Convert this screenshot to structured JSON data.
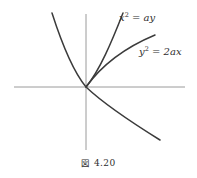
{
  "figure": {
    "caption_label": "図",
    "caption_number": "4.20",
    "background_color": "#ffffff",
    "curve_color": "#3b3b3b",
    "axis_color": "#9a9a9a"
  },
  "labels": {
    "parabola_up": {
      "variable": "x",
      "exponent": "2",
      "operator": "=",
      "expression": "ay",
      "full_text": "x2 = ay"
    },
    "parabola_right": {
      "variable": "y",
      "exponent": "2",
      "operator": "=",
      "expression": "2ax",
      "full_text": "y2 = 2ax"
    }
  },
  "chart_data": {
    "type": "line",
    "title": "",
    "subtitle": "",
    "xlabel": "",
    "ylabel": "",
    "grid": false,
    "legend_position": "inline-annotation",
    "origin_px": [
      86,
      87
    ],
    "axes": {
      "x_axis": {
        "x1": 14,
        "y1": 87,
        "x2": 185,
        "y2": 87
      },
      "y_axis": {
        "x1": 86,
        "y1": 14,
        "x2": 86,
        "y2": 150
      }
    },
    "annotations": [
      {
        "text": "x2 = ay",
        "x_px": 119,
        "y_px": 13,
        "target": "parabola_up"
      },
      {
        "text": "y2 = 2ax",
        "x_px": 139,
        "y_px": 47,
        "target": "parabola_right"
      }
    ],
    "series": [
      {
        "name": "x2 = ay",
        "equation": "x^2 = ay",
        "orientation": "opens-upward",
        "vertex": [
          0,
          0
        ],
        "path": "M 52 13 C 61 41, 72 70, 86 87 C 100 70, 112 41, 123 13"
      },
      {
        "name": "y2 = 2ax",
        "equation": "y^2 = 2ax",
        "orientation": "opens-rightward",
        "vertex": [
          0,
          0
        ],
        "path": "M 155 35 C 131 45, 104 62, 86 87 C 104 104, 131 122, 160 140"
      }
    ]
  }
}
